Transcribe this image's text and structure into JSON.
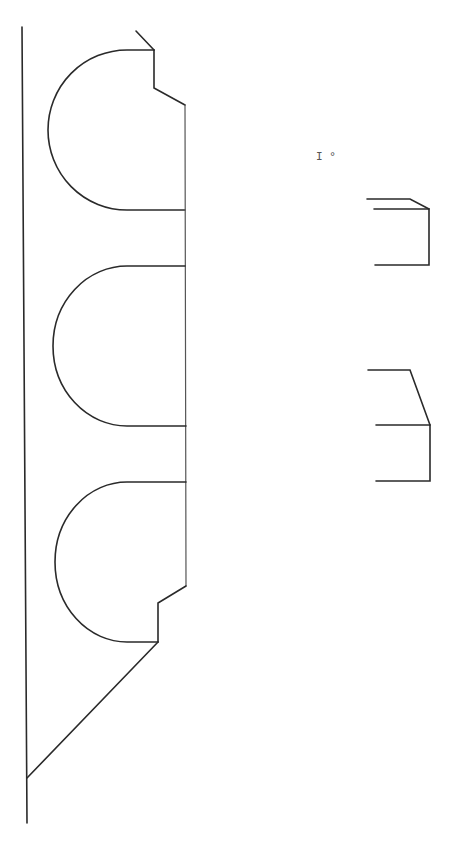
{
  "diagram": {
    "type": "technical-line-drawing",
    "background": "#ffffff",
    "stroke_color": "#2a2a2a",
    "label": {
      "text": "I",
      "symbol": "°"
    },
    "components": [
      {
        "name": "base-line",
        "kind": "vertical-line"
      },
      {
        "name": "profile-top",
        "kind": "semicircle-with-notch"
      },
      {
        "name": "profile-middle",
        "kind": "semicircle"
      },
      {
        "name": "profile-bottom",
        "kind": "semicircle-with-notch"
      },
      {
        "name": "bottom-diagonal",
        "kind": "diagonal-line"
      },
      {
        "name": "detail-upper",
        "kind": "bracket-with-bevel"
      },
      {
        "name": "detail-lower",
        "kind": "bracket-with-bevel"
      }
    ]
  }
}
